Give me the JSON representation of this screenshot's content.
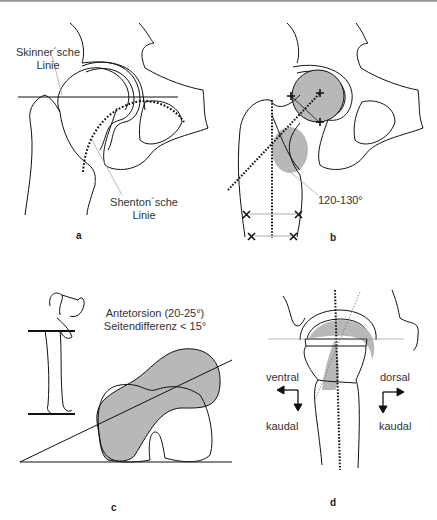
{
  "figure": {
    "panels": [
      {
        "id": "a",
        "label": "a",
        "annotations": [
          "Skinner´sche",
          "Linie",
          "Shenton´sche",
          "Linie"
        ]
      },
      {
        "id": "b",
        "label": "b",
        "annotations": [
          "120-130°"
        ]
      },
      {
        "id": "c",
        "label": "c",
        "annotations": [
          "Antetorsion (20-25°)",
          "Seitendifferenz < 15°"
        ]
      },
      {
        "id": "d",
        "label": "d",
        "annotations": [
          "ventral",
          "kaudal",
          "dorsal",
          "kaudal"
        ]
      }
    ]
  },
  "a": {
    "skinner_1": "Skinner´sche",
    "skinner_2": "Linie",
    "shenton_1": "Shenton´sche",
    "shenton_2": "Linie",
    "label": "a"
  },
  "b": {
    "angle": "120-130°",
    "label": "b"
  },
  "c": {
    "line1": "Antetorsion (20-25°)",
    "line2": "Seitendifferenz < 15°",
    "label": "c"
  },
  "d": {
    "ventral": "ventral",
    "kaudal_left": "kaudal",
    "dorsal": "dorsal",
    "kaudal_right": "kaudal",
    "label": "d"
  },
  "colors": {
    "fill": "#b8b8b8",
    "line": "#111111",
    "guide": "#9a9a9a"
  }
}
